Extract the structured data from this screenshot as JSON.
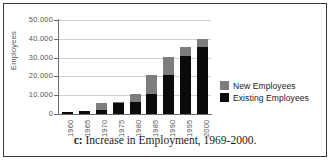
{
  "caption": {
    "tag": "c:",
    "text": " Increase in Employment, 1969-2000."
  },
  "legend": {
    "items": [
      {
        "label": "New Employees",
        "color": "#7d7d7d"
      },
      {
        "label": "Existing Employees",
        "color": "#0a0a0a"
      }
    ]
  },
  "chart_data": {
    "type": "bar",
    "stacked": true,
    "title": "",
    "xlabel": "",
    "ylabel": "Employees",
    "categories": [
      "1960",
      "1965",
      "1970",
      "1975",
      "1980",
      "1985",
      "1990",
      "1995",
      "2000"
    ],
    "ylim": [
      0,
      50000
    ],
    "ytick_labels": [
      "50.000",
      "40.000",
      "30.000",
      "20.000",
      "10.000",
      "0"
    ],
    "ytick_values": [
      50000,
      40000,
      30000,
      20000,
      10000,
      0
    ],
    "grid": true,
    "legend_position": "right",
    "series": [
      {
        "name": "Existing Employees",
        "color": "#0a0a0a",
        "values": [
          1000,
          1800,
          2200,
          6000,
          6600,
          10500,
          20500,
          31000,
          35500
        ]
      },
      {
        "name": "New Employees",
        "color": "#7d7d7d",
        "values": [
          0,
          0,
          3600,
          200,
          4200,
          10500,
          10000,
          4500,
          4500
        ]
      }
    ],
    "totals": [
      1000,
      1800,
      5800,
      6200,
      10800,
      21000,
      30500,
      35500,
      40000
    ]
  }
}
